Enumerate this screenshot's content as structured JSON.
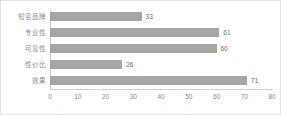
{
  "chart_data": {
    "type": "bar",
    "orientation": "horizontal",
    "title": "",
    "xlabel": "",
    "ylabel": "",
    "categories": [
      "知名品牌",
      "专业性",
      "可靠性",
      "性价比",
      "效果"
    ],
    "values": [
      33,
      61,
      60,
      26,
      71
    ],
    "data_labels": [
      "33",
      "61",
      "60",
      "26",
      "71"
    ],
    "xlim": [
      0,
      80
    ],
    "xticks": [
      0,
      10,
      20,
      30,
      40,
      50,
      60,
      70,
      80
    ],
    "xtick_labels": [
      "0",
      "10",
      "20",
      "30",
      "40",
      "50",
      "60",
      "70",
      "80"
    ],
    "grid": false,
    "legend": false,
    "bar_color": "#a6a6a6",
    "axis_color": "#d0d0d0",
    "label_color": "#8a8a8a",
    "value_color": "#6b6b6b",
    "background": "#ffffff",
    "border_color": "#e3e3e3"
  }
}
